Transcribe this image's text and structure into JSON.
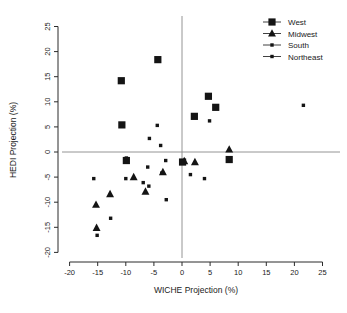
{
  "chart_data": {
    "type": "scatter",
    "title": "",
    "xlabel": "WICHE Projection (%)",
    "ylabel": "HEDI Projection (%)",
    "xlim": [
      -20,
      25
    ],
    "ylim": [
      -20,
      25
    ],
    "xticks": [
      -20,
      -15,
      -10,
      -5,
      0,
      5,
      10,
      15,
      20,
      25
    ],
    "yticks": [
      -20,
      -15,
      -10,
      -5,
      0,
      5,
      10,
      15,
      20,
      25
    ],
    "xtick_labels": [
      "-20",
      "-15",
      "-10",
      "-5",
      "0",
      "5",
      "10",
      "15",
      "20",
      "25"
    ],
    "ytick_labels": [
      "-20",
      "-15",
      "-10",
      "-5",
      "0",
      "5",
      "10",
      "15",
      "20",
      "25"
    ],
    "grid": false,
    "reference_lines": [
      {
        "axis": "horizontal",
        "value": 0
      },
      {
        "axis": "vertical",
        "value": 0
      }
    ],
    "legend_position": "top-right",
    "series": [
      {
        "name": "West",
        "marker": "square",
        "marker_size": "large",
        "color": "#141414",
        "points": [
          {
            "x": -4.3,
            "y": 18.4
          },
          {
            "x": -10.8,
            "y": 14.2
          },
          {
            "x": -10.7,
            "y": 5.4
          },
          {
            "x": 4.7,
            "y": 11.1
          },
          {
            "x": 6.0,
            "y": 8.9
          },
          {
            "x": 2.2,
            "y": 7.1
          },
          {
            "x": -9.9,
            "y": -1.7
          },
          {
            "x": 0.1,
            "y": -2.0
          },
          {
            "x": 8.4,
            "y": -1.5
          }
        ]
      },
      {
        "name": "Midwest",
        "marker": "triangle",
        "marker_size": "medium",
        "color": "#141414",
        "points": [
          {
            "x": 8.4,
            "y": 0.5
          },
          {
            "x": -3.4,
            "y": -4.0
          },
          {
            "x": -8.6,
            "y": -5.0
          },
          {
            "x": -6.5,
            "y": -7.9
          },
          {
            "x": -12.8,
            "y": -8.4
          },
          {
            "x": -15.3,
            "y": -10.5
          },
          {
            "x": -15.2,
            "y": -15.1
          },
          {
            "x": 0.4,
            "y": -1.8
          },
          {
            "x": 2.3,
            "y": -2.0
          }
        ]
      },
      {
        "name": "South",
        "marker": "small-square",
        "marker_size": "small",
        "color": "#141414",
        "points": [
          {
            "x": 21.6,
            "y": 9.3
          },
          {
            "x": 4.9,
            "y": 6.2
          },
          {
            "x": -4.4,
            "y": 5.3
          },
          {
            "x": -5.8,
            "y": 2.7
          },
          {
            "x": -3.8,
            "y": 1.3
          },
          {
            "x": -9.9,
            "y": -1.2
          },
          {
            "x": -2.9,
            "y": -1.7
          },
          {
            "x": -6.1,
            "y": -3.0
          },
          {
            "x": -3.6,
            "y": -4.2
          },
          {
            "x": 1.5,
            "y": -4.5
          },
          {
            "x": -15.7,
            "y": -5.3
          },
          {
            "x": -10.0,
            "y": -5.3
          },
          {
            "x": 4.0,
            "y": -5.3
          },
          {
            "x": -6.9,
            "y": -6.1
          },
          {
            "x": -5.9,
            "y": -6.8
          },
          {
            "x": -2.8,
            "y": -9.5
          },
          {
            "x": -12.7,
            "y": -13.2
          },
          {
            "x": -15.1,
            "y": -16.6
          }
        ]
      },
      {
        "name": "Northeast",
        "marker": "small-plus",
        "marker_size": "small",
        "color": "#141414",
        "points": []
      }
    ]
  },
  "axes": {
    "x_title": "WICHE Projection (%)",
    "y_title": "HEDI Projection (%)"
  },
  "legend": {
    "entries": [
      {
        "label": "West",
        "marker": "square"
      },
      {
        "label": "Midwest",
        "marker": "triangle"
      },
      {
        "label": "South",
        "marker": "small-square"
      },
      {
        "label": "Northeast",
        "marker": "small-plus"
      }
    ]
  }
}
